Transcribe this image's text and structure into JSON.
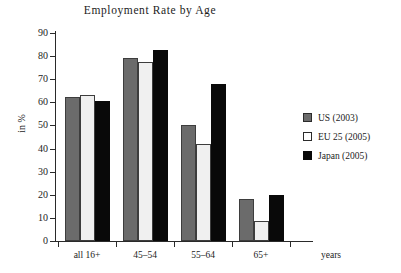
{
  "chart_data": {
    "type": "bar",
    "title": "Employment Rate by Age",
    "xlabel": "years",
    "ylabel": "in %",
    "ylim": [
      0,
      90
    ],
    "yticks": [
      0,
      10,
      20,
      30,
      40,
      50,
      60,
      70,
      80,
      90
    ],
    "ytick_labels": [
      "0",
      "10",
      "20",
      "30",
      "40",
      "50",
      "60",
      "70",
      "80",
      "90"
    ],
    "grid": false,
    "legend_position": "right",
    "categories": [
      "all 16+",
      "45–54",
      "55–64",
      "65+"
    ],
    "series": [
      {
        "name": "US (2003)",
        "color": "#6b6b6b",
        "values": [
          62.5,
          79.2,
          50.1,
          18.0
        ]
      },
      {
        "name": "EU 25 (2005)",
        "color": "#f0f0f0",
        "values": [
          63.3,
          77.5,
          41.8,
          8.7
        ]
      },
      {
        "name": "Japan (2005)",
        "color": "#090909",
        "values": [
          60.5,
          82.5,
          68.0,
          20.0
        ]
      }
    ]
  },
  "legend": {
    "items": [
      {
        "label": "US (2003)",
        "swatch": "gray-swatch-icon"
      },
      {
        "label": "EU 25 (2005)",
        "swatch": "white-swatch-icon"
      },
      {
        "label": "Japan (2005)",
        "swatch": "black-swatch-icon"
      }
    ]
  }
}
